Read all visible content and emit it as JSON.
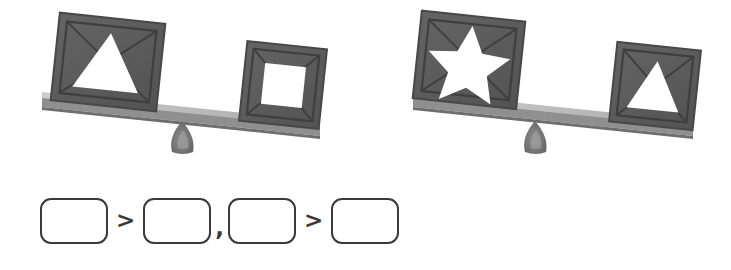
{
  "page": {
    "background_color": "#ffffff"
  },
  "palette": {
    "crate_face": "#5c5c5c",
    "crate_frame": "#4a4a4a",
    "crate_edge_dark": "#3f3f3f",
    "crate_shade": "#6a6a6a",
    "beam_top": "#c2c2c2",
    "beam_front": "#9a9a9a",
    "beam_edge": "#7e7e7e",
    "fulcrum": "#6f6f6f",
    "fulcrum_highlight": "#9d9d9d",
    "cutout_white": "#ffffff",
    "outline_dark": "#3a3a3c"
  },
  "scales": [
    {
      "id": "scale-left",
      "name": "balance-scale-left",
      "tilt": "left-side-down",
      "left_pan": {
        "crate_shape": "triangle",
        "shape_label": "triangle",
        "position": "down",
        "relative_weight": "heavier"
      },
      "right_pan": {
        "crate_shape": "square",
        "shape_label": "square",
        "position": "up",
        "relative_weight": "lighter"
      },
      "relation": "triangle > square"
    },
    {
      "id": "scale-right",
      "name": "balance-scale-right",
      "tilt": "left-side-down",
      "left_pan": {
        "crate_shape": "star",
        "shape_label": "star",
        "position": "down",
        "relative_weight": "heavier"
      },
      "right_pan": {
        "crate_shape": "triangle",
        "shape_label": "triangle",
        "position": "up",
        "relative_weight": "lighter"
      },
      "relation": "star > triangle"
    }
  ],
  "answer_row": {
    "name": "comparison-answer-row",
    "boxes": [
      {
        "index": 1,
        "value": "",
        "placeholder": ""
      },
      {
        "index": 2,
        "value": "",
        "placeholder": ""
      },
      {
        "index": 3,
        "value": "",
        "placeholder": ""
      },
      {
        "index": 4,
        "value": "",
        "placeholder": ""
      }
    ],
    "operators": {
      "first": ">",
      "separator": ",",
      "second": ">"
    }
  }
}
